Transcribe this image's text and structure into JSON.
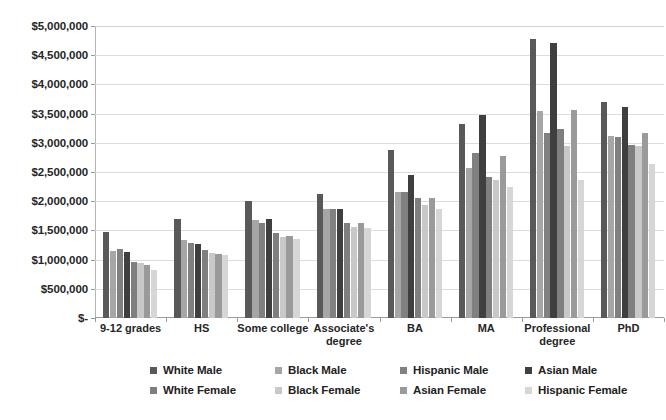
{
  "chart_data": {
    "type": "bar",
    "title": "",
    "subtitle": "",
    "xlabel": "",
    "ylabel": "",
    "grid": true,
    "legend_position": "bottom",
    "ylim": [
      0,
      5000000
    ],
    "ytick_step": 500000,
    "ytick_labels": [
      "$5,000,000",
      "$4,500,000",
      "$4,000,000",
      "$3,500,000",
      "$3,000,000",
      "$2,500,000",
      "$2,000,000",
      "$1,500,000",
      "$1,000,000",
      "$500,000",
      "$-"
    ],
    "ytick_values": [
      5000000,
      4500000,
      4000000,
      3500000,
      3000000,
      2500000,
      2000000,
      1500000,
      1000000,
      500000,
      0
    ],
    "categories": [
      "9-12 grades",
      "HS",
      "Some college",
      "Associate's degree",
      "BA",
      "MA",
      "Professional degree",
      "PhD"
    ],
    "series": [
      {
        "name": "White Male",
        "color": "#595959",
        "values": [
          1470000,
          1700000,
          2010000,
          2120000,
          2870000,
          3330000,
          4770000,
          3700000
        ]
      },
      {
        "name": "Black Male",
        "color": "#a6a6a6",
        "values": [
          1150000,
          1330000,
          1670000,
          1870000,
          2150000,
          2570000,
          3540000,
          3110000
        ]
      },
      {
        "name": "Hispanic Male",
        "color": "#808080",
        "values": [
          1180000,
          1290000,
          1620000,
          1870000,
          2150000,
          2820000,
          3170000,
          3100000
        ]
      },
      {
        "name": "Asian Male",
        "color": "#3f3f3f",
        "values": [
          1130000,
          1270000,
          1690000,
          1870000,
          2450000,
          3470000,
          4710000,
          3620000
        ]
      },
      {
        "name": "White Female",
        "color": "#7f7f7f",
        "values": [
          960000,
          1170000,
          1450000,
          1620000,
          2060000,
          2420000,
          3230000,
          2960000
        ]
      },
      {
        "name": "Black Female",
        "color": "#c8c8c8",
        "values": [
          950000,
          1120000,
          1390000,
          1550000,
          1940000,
          2370000,
          2940000,
          2940000
        ]
      },
      {
        "name": "Asian Female",
        "color": "#9a9a9a",
        "values": [
          900000,
          1100000,
          1400000,
          1620000,
          2060000,
          2770000,
          3570000,
          3170000
        ]
      },
      {
        "name": "Hispanic Female",
        "color": "#d6d6d6",
        "values": [
          820000,
          1080000,
          1350000,
          1540000,
          1870000,
          2240000,
          2360000,
          2640000
        ]
      }
    ]
  },
  "legend": {
    "rows": [
      [
        "White Male",
        "Black Male",
        "Hispanic Male",
        "Asian Male"
      ],
      [
        "White Female",
        "Black Female",
        "Asian Female",
        "Hispanic Female"
      ]
    ]
  }
}
